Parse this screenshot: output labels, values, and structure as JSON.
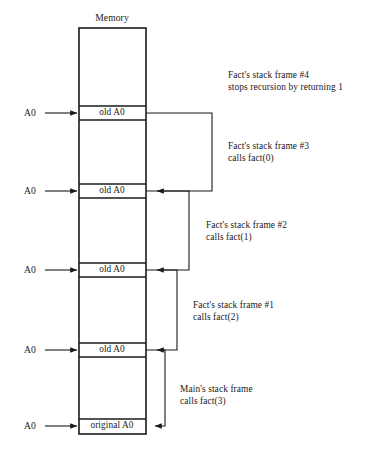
{
  "figure": {
    "memory_title": "Memory",
    "pointer_label": "A0",
    "slots": [
      {
        "id": "slot-1",
        "label": "old A0"
      },
      {
        "id": "slot-2",
        "label": "old A0"
      },
      {
        "id": "slot-3",
        "label": "old A0"
      },
      {
        "id": "slot-4",
        "label": "old A0"
      },
      {
        "id": "slot-5",
        "label": "original A0"
      }
    ],
    "pointers": [
      {
        "id": "pointer-1",
        "label": "A0"
      },
      {
        "id": "pointer-2",
        "label": "A0"
      },
      {
        "id": "pointer-3",
        "label": "A0"
      },
      {
        "id": "pointer-4",
        "label": "A0"
      },
      {
        "id": "pointer-5",
        "label": "A0"
      }
    ],
    "annotations": [
      {
        "id": "frame-4",
        "line1": "Fact's stack frame #4",
        "line2": "stops recursion by returning 1"
      },
      {
        "id": "frame-3",
        "line1": "Fact's stack frame #3",
        "line2": "calls fact(0)"
      },
      {
        "id": "frame-2",
        "line1": "Fact's stack frame #2",
        "line2": "calls fact(1)"
      },
      {
        "id": "frame-1",
        "line1": "Fact's stack frame #1",
        "line2": "calls fact(2)"
      },
      {
        "id": "main-frame",
        "line1": "Main's stack frame",
        "line2": "calls fact(3)"
      }
    ],
    "colors": {
      "ink": "#1a1a1a",
      "background": "#ffffff"
    }
  }
}
